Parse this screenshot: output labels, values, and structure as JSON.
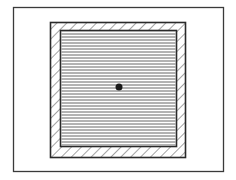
{
  "diagram": {
    "colors": {
      "background": "#ffffff",
      "stroke": "#3a3a3a",
      "hatch": "#555555",
      "lines": "#666666",
      "dot": "#1a1a1a"
    },
    "outer_frame": {
      "x": 13,
      "y": 7,
      "width": 210,
      "height": 164
    },
    "hatched_square": {
      "x": 50,
      "y": 22,
      "width": 135,
      "height": 135,
      "hatch_direction": "backslash",
      "hatch_spacing": 7
    },
    "inner_square": {
      "x": 60,
      "y": 30,
      "width": 116,
      "height": 116,
      "line_orientation": "horizontal",
      "line_spacing": 3
    },
    "center_dot": {
      "cx": 119,
      "cy": 87,
      "r": 3.5
    },
    "labels": []
  }
}
